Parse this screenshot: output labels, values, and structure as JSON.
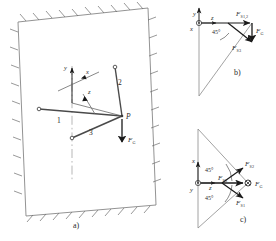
{
  "figure": {
    "panels": [
      {
        "key": "a",
        "label": "a)",
        "label_x": 73,
        "label_y": 228,
        "description": "Spatial view: wall plane with three rods meeting at point P carrying weight F_G",
        "point_label": "P",
        "weight_label": "F",
        "weight_sub": "G",
        "rods": [
          {
            "name": "rod-1",
            "label": "1",
            "x": 57,
            "y": 123
          },
          {
            "name": "rod-2",
            "label": "2",
            "x": 118,
            "y": 85
          },
          {
            "name": "rod-3",
            "label": "3",
            "x": 89,
            "y": 135
          }
        ],
        "axes": [
          {
            "name": "axis-y",
            "label": "y",
            "x": 64,
            "y": 70
          },
          {
            "name": "axis-x",
            "label": "x",
            "x": 86,
            "y": 74
          },
          {
            "name": "axis-z",
            "label": "z",
            "x": 88,
            "y": 94
          }
        ]
      },
      {
        "key": "b",
        "label": "b)",
        "label_x": 234,
        "label_y": 75,
        "description": "Projection onto y-z plane: forces F_S1,2 horizontal, F_S3 at 45 degrees, weight F_G vertical",
        "angle_label": "45°",
        "axes": [
          {
            "name": "axis-y",
            "label": "y",
            "x": 193,
            "y": 16
          },
          {
            "name": "axis-z",
            "label": "z",
            "x": 211,
            "y": 20
          },
          {
            "name": "axis-x",
            "label": "x",
            "x": 190,
            "y": 31
          }
        ],
        "forces": [
          {
            "name": "force-FS12",
            "label": "F",
            "sub": "S1,2",
            "x": 236,
            "y": 16
          },
          {
            "name": "force-FS3",
            "label": "F",
            "sub": "S3",
            "x": 237,
            "y": 46
          },
          {
            "name": "force-FG",
            "label": "F",
            "sub": "G",
            "x": 258,
            "y": 31
          }
        ]
      },
      {
        "key": "c",
        "label": "c)",
        "label_x": 240,
        "label_y": 222,
        "description": "Projection onto x-z plane: forces F_S1 and F_S2 at 45 degrees, F_S3 horizontal, weight F_G",
        "angle_labels": [
          "45°",
          "45°"
        ],
        "axes": [
          {
            "name": "axis-x",
            "label": "x",
            "x": 192,
            "y": 163
          },
          {
            "name": "axis-y",
            "label": "y",
            "x": 190,
            "y": 190
          },
          {
            "name": "axis-z",
            "label": "z",
            "x": 209,
            "y": 190
          }
        ],
        "forces": [
          {
            "name": "force-FS2",
            "label": "F",
            "sub": "S2",
            "x": 245,
            "y": 166
          },
          {
            "name": "force-FS3",
            "label": "F",
            "sub": "S3",
            "x": 222,
            "y": 180
          },
          {
            "name": "force-FS1",
            "label": "F",
            "sub": "S1",
            "x": 240,
            "y": 201
          },
          {
            "name": "force-FG",
            "label": "F",
            "sub": "G",
            "x": 257,
            "y": 184
          }
        ]
      }
    ],
    "colors": {
      "stroke": "#555555",
      "ink": "#2b2b2b",
      "arrow": "#1a1a1a",
      "background": "#ffffff"
    }
  }
}
